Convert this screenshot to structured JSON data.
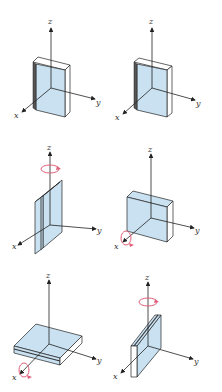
{
  "figure": {
    "panels": [
      {
        "id": "a",
        "axes": {
          "x": "x",
          "y": "y",
          "z": "z"
        },
        "orientation": "slab upright in xz-plane, thin along x (front view)",
        "rotation": null
      },
      {
        "id": "b",
        "axes": {
          "x": "x",
          "y": "y",
          "z": "z"
        },
        "orientation": "slab upright in xz-plane, thin along x (duplicate view)",
        "rotation": null
      },
      {
        "id": "c",
        "axes": {
          "x": "x",
          "y": "y",
          "z": "z"
        },
        "orientation": "slab upright, edge facing x, thin along y",
        "rotation": {
          "axis": "z"
        }
      },
      {
        "id": "d",
        "axes": {
          "x": "x",
          "y": "y",
          "z": "z"
        },
        "orientation": "slab upright, face toward x, seam along top",
        "rotation": {
          "axis": "x"
        }
      },
      {
        "id": "e",
        "axes": {
          "x": "x",
          "y": "y",
          "z": "z"
        },
        "orientation": "slab lying flat in xy-plane",
        "rotation": {
          "axis": "x"
        }
      },
      {
        "id": "f",
        "axes": {
          "x": "x",
          "y": "y",
          "z": "z"
        },
        "orientation": "slab upright, rotated about z, thin along y",
        "rotation": {
          "axis": "z"
        }
      }
    ],
    "colors": {
      "slab_face": "#c9e1f1",
      "slab_edge": "#ffffff",
      "outline": "#222222",
      "rotation_arrow": "#e0607a"
    },
    "labels": {
      "x": "x",
      "y": "y",
      "z": "z"
    }
  }
}
